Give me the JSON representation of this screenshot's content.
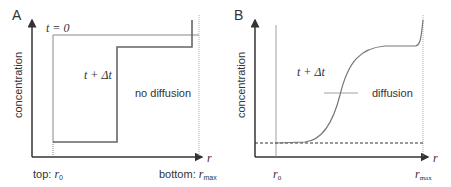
{
  "panels": [
    {
      "id": "A",
      "label": "A",
      "ylabel": "concentration",
      "xlabel": "r",
      "curve_t0_label": "t = 0",
      "curve_dt_label": "t + Δt",
      "annotation": "no diffusion",
      "x_left_label_prefix": "top: ",
      "x_left_label_sym": "r",
      "x_left_label_sub": "0",
      "x_right_label_prefix": "bottom: ",
      "x_right_label_sym": "r",
      "x_right_label_sub": "max"
    },
    {
      "id": "B",
      "label": "B",
      "ylabel": "concentration",
      "xlabel": "r",
      "curve_dt_label": "t + Δt",
      "annotation": "diffusion",
      "x_left_label_sym": "r",
      "x_left_label_sub": "0",
      "x_right_label_sym": "r",
      "x_right_label_sub": "max"
    }
  ],
  "colors": {
    "axis": "#333333",
    "curve": "#777777",
    "guide": "#999999"
  }
}
